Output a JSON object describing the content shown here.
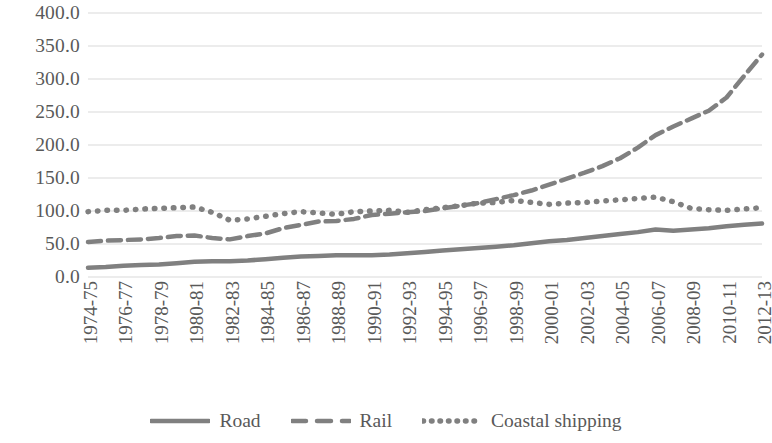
{
  "chart_data": {
    "type": "line",
    "title": "",
    "subtitle": "",
    "xlabel": "",
    "ylabel": "",
    "ylim": [
      0,
      400
    ],
    "ytick_step": 50,
    "ytick_labels": [
      "400.0",
      "350.0",
      "300.0",
      "250.0",
      "200.0",
      "150.0",
      "100.0",
      "50.0",
      "0.0"
    ],
    "ytick_values": [
      400,
      350,
      300,
      250,
      200,
      150,
      100,
      50,
      0
    ],
    "grid": "horizontal",
    "legend_position": "bottom",
    "categories": [
      "1974-75",
      "1975-76",
      "1976-77",
      "1977-78",
      "1978-79",
      "1979-80",
      "1980-81",
      "1981-82",
      "1982-83",
      "1983-84",
      "1984-85",
      "1985-86",
      "1986-87",
      "1987-88",
      "1988-89",
      "1989-90",
      "1990-91",
      "1991-92",
      "1992-93",
      "1993-94",
      "1994-95",
      "1995-96",
      "1996-97",
      "1997-98",
      "1998-99",
      "1999-00",
      "2000-01",
      "2001-02",
      "2002-03",
      "2003-04",
      "2004-05",
      "2005-06",
      "2006-07",
      "2007-08",
      "2008-09",
      "2009-10",
      "2010-11",
      "2011-12",
      "2012-13"
    ],
    "xtick_labels": [
      "1974-75",
      "1976-77",
      "1978-79",
      "1980-81",
      "1982-83",
      "1984-85",
      "1986-87",
      "1988-89",
      "1990-91",
      "1992-93",
      "1994-95",
      "1996-97",
      "1998-99",
      "2000-01",
      "2002-03",
      "2004-05",
      "2006-07",
      "2008-09",
      "2010-11",
      "2012-13"
    ],
    "series": [
      {
        "name": "Road",
        "style": "solid",
        "color": "#808080",
        "values": [
          14,
          15,
          17,
          18,
          19,
          21,
          23,
          24,
          24,
          25,
          27,
          29,
          31,
          32,
          33,
          33,
          33,
          34,
          36,
          38,
          40,
          42,
          44,
          46,
          48,
          51,
          54,
          56,
          59,
          62,
          65,
          68,
          72,
          70,
          72,
          74,
          77,
          79,
          81
        ]
      },
      {
        "name": "Rail",
        "style": "dashed",
        "color": "#808080",
        "values": [
          53,
          55,
          56,
          57,
          59,
          62,
          63,
          59,
          57,
          62,
          66,
          74,
          79,
          84,
          85,
          88,
          94,
          96,
          98,
          100,
          104,
          108,
          112,
          118,
          124,
          131,
          140,
          149,
          158,
          168,
          180,
          196,
          215,
          228,
          240,
          252,
          272,
          305,
          337
        ]
      },
      {
        "name": "Coastal shipping",
        "style": "dotted",
        "color": "#808080",
        "values": [
          99,
          101,
          101,
          103,
          104,
          105,
          106,
          98,
          86,
          88,
          92,
          96,
          99,
          97,
          95,
          99,
          100,
          101,
          98,
          102,
          105,
          108,
          112,
          113,
          116,
          113,
          110,
          112,
          113,
          115,
          117,
          119,
          121,
          114,
          104,
          102,
          101,
          103,
          105
        ]
      }
    ]
  },
  "legend": {
    "items": [
      {
        "label": "Road",
        "swatch": "solid-line-swatch"
      },
      {
        "label": "Rail",
        "swatch": "dashed-line-swatch"
      },
      {
        "label": "Coastal shipping",
        "swatch": "dotted-line-swatch"
      }
    ]
  },
  "colors": {
    "series": "#808080",
    "gridline": "#d9d9d9",
    "text": "#595959",
    "background": "#ffffff"
  }
}
